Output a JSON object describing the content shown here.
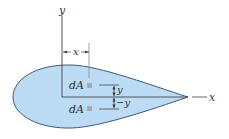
{
  "diagram": {
    "title": "",
    "shape": {
      "fill": "#bcdcf5",
      "stroke": "#3f5a78"
    },
    "axes": {
      "y_label": "y",
      "x_label": "x"
    },
    "dimension_x": {
      "label": "x"
    },
    "elements": [
      {
        "label": "dA",
        "marker_color": "#a9a9a9",
        "position": "upper"
      },
      {
        "label": "dA",
        "marker_color": "#a9a9a9",
        "position": "lower"
      }
    ],
    "dimension_upper_y": {
      "label": "y"
    },
    "dimension_lower_y": {
      "label": "−y"
    }
  }
}
